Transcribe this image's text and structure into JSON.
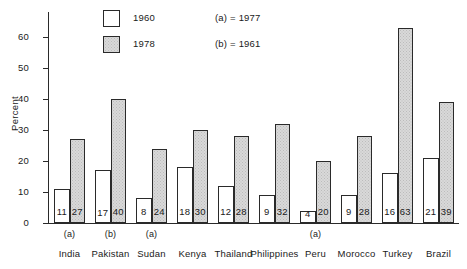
{
  "chart_data": {
    "type": "bar",
    "title": "",
    "xlabel": "",
    "ylabel": "Percent",
    "ylim": [
      0,
      68
    ],
    "yticks": [
      0,
      10,
      20,
      30,
      40,
      50,
      60
    ],
    "grid": false,
    "legend_position": "top-center",
    "categories": [
      "India",
      "Pakistan",
      "Sudan",
      "Kenya",
      "Thailand",
      "Philippines",
      "Peru",
      "Morocco",
      "Turkey",
      "Brazil"
    ],
    "category_markers": [
      "(a)",
      "(b)",
      "(a)",
      "",
      "",
      "",
      "(a)",
      "",
      "",
      ""
    ],
    "series": [
      {
        "name": "1960",
        "fill": "white",
        "values": [
          11,
          17,
          8,
          18,
          12,
          9,
          4,
          9,
          16,
          21
        ]
      },
      {
        "name": "1978",
        "fill": "gray",
        "values": [
          27,
          40,
          24,
          30,
          28,
          32,
          20,
          28,
          63,
          39
        ]
      }
    ],
    "annotations": [
      {
        "key": "(a)",
        "text": "(a) = 1977"
      },
      {
        "key": "(b)",
        "text": "(b) = 1961"
      }
    ]
  },
  "legend": {
    "entries": [
      {
        "label": "1960",
        "note": "(a) = 1977"
      },
      {
        "label": "1978",
        "note": "(b) = 1961"
      }
    ]
  },
  "colors": {
    "bar_white": "#ffffff",
    "bar_gray": "#d9d9d9",
    "axis": "#2a2a2a",
    "text": "#1a1a1a",
    "background": "#ffffff"
  }
}
